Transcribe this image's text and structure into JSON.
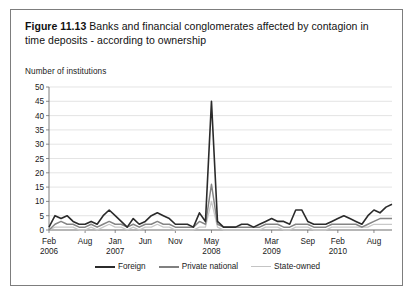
{
  "figure": {
    "label": "Figure 11.13",
    "caption": "Banks and financial conglomerates affected by contagion in time deposits - according to ownership"
  },
  "chart_data": {
    "type": "line",
    "title": "Banks and financial conglomerates affected by contagion in time deposits - according to ownership",
    "xlabel": "",
    "ylabel": "Number of institutions",
    "ylim": [
      0,
      50
    ],
    "yticks": [
      0,
      5,
      10,
      15,
      20,
      25,
      30,
      35,
      40,
      45,
      50
    ],
    "grid": true,
    "legend_position": "bottom",
    "xtick_positions": [
      0,
      6,
      11,
      16,
      21,
      27,
      37,
      43,
      48,
      54
    ],
    "xtick_labels": [
      {
        "month": "Feb",
        "year": "2006"
      },
      {
        "month": "Aug",
        "year": ""
      },
      {
        "month": "Jan",
        "year": "2007"
      },
      {
        "month": "Jun",
        "year": ""
      },
      {
        "month": "Nov",
        "year": ""
      },
      {
        "month": "May",
        "year": "2008"
      },
      {
        "month": "Mar",
        "year": "2009"
      },
      {
        "month": "Sep",
        "year": ""
      },
      {
        "month": "Feb",
        "year": "2010"
      },
      {
        "month": "Aug",
        "year": ""
      }
    ],
    "x": [
      0,
      1,
      2,
      3,
      4,
      5,
      6,
      7,
      8,
      9,
      10,
      11,
      12,
      13,
      14,
      15,
      16,
      17,
      18,
      19,
      20,
      21,
      22,
      23,
      24,
      25,
      26,
      27,
      28,
      29,
      30,
      31,
      32,
      33,
      34,
      35,
      36,
      37,
      38,
      39,
      40,
      41,
      42,
      43,
      44,
      45,
      46,
      47,
      48,
      49,
      50,
      51,
      52,
      53,
      54,
      55,
      56,
      57
    ],
    "series": [
      {
        "name": "Foreign",
        "color": "#2b2b2b",
        "values": [
          1,
          5,
          4,
          5,
          3,
          2,
          2,
          3,
          2,
          5,
          7,
          5,
          3,
          1,
          4,
          2,
          3,
          5,
          6,
          5,
          4,
          2,
          2,
          2,
          1,
          6,
          3,
          45,
          3,
          1,
          1,
          1,
          2,
          2,
          1,
          2,
          3,
          4,
          3,
          3,
          2,
          7,
          7,
          3,
          2,
          2,
          2,
          3,
          4,
          5,
          4,
          3,
          2,
          5,
          7,
          6,
          8,
          9
        ]
      },
      {
        "name": "Private national",
        "color": "#858585",
        "values": [
          0,
          2,
          3,
          2,
          2,
          1,
          1,
          2,
          1,
          2,
          3,
          2,
          2,
          1,
          2,
          1,
          2,
          2,
          3,
          2,
          2,
          1,
          1,
          1,
          1,
          3,
          2,
          16,
          2,
          1,
          1,
          1,
          1,
          1,
          1,
          1,
          2,
          2,
          2,
          1,
          1,
          2,
          2,
          2,
          1,
          1,
          1,
          2,
          2,
          2,
          2,
          2,
          1,
          2,
          3,
          4,
          4,
          4
        ]
      },
      {
        "name": "State-owned",
        "color": "#c9c9c9",
        "values": [
          0,
          1,
          1,
          1,
          1,
          0,
          0,
          1,
          0,
          1,
          2,
          1,
          1,
          0,
          1,
          0,
          1,
          1,
          2,
          1,
          1,
          0,
          0,
          0,
          0,
          1,
          1,
          10,
          1,
          0,
          0,
          0,
          0,
          0,
          0,
          0,
          1,
          1,
          1,
          0,
          0,
          1,
          1,
          1,
          0,
          0,
          0,
          1,
          1,
          1,
          1,
          1,
          1,
          1,
          2,
          2,
          2,
          2
        ]
      }
    ]
  },
  "legend": {
    "items": [
      {
        "label": "Foreign"
      },
      {
        "label": "Private national"
      },
      {
        "label": "State-owned"
      }
    ]
  }
}
